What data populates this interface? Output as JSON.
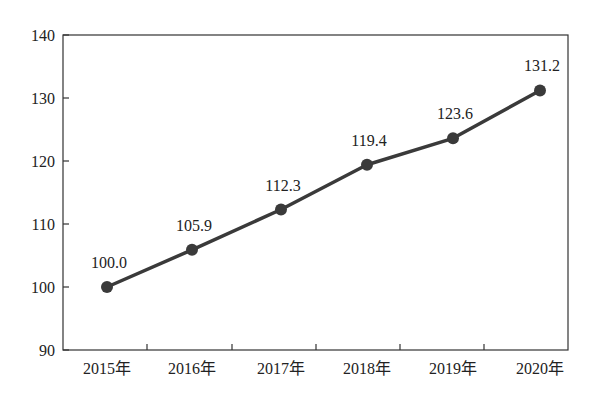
{
  "chart_data": {
    "type": "line",
    "title": "",
    "xlabel": "",
    "ylabel": "",
    "categories": [
      "2015年",
      "2016年",
      "2017年",
      "2018年",
      "2019年",
      "2020年"
    ],
    "series": [
      {
        "name": "index",
        "values": [
          100.0,
          105.9,
          112.3,
          119.4,
          123.6,
          131.2
        ]
      }
    ],
    "data_labels": [
      "100.0",
      "105.9",
      "112.3",
      "119.4",
      "123.6",
      "131.2"
    ],
    "ylim": [
      90,
      140
    ],
    "yticks": [
      "90",
      "100",
      "110",
      "120",
      "130",
      "140"
    ],
    "grid": false,
    "legend": "none",
    "colors": {
      "line": "#3a3a3a",
      "marker": "#3a3a3a",
      "axis": "#333333"
    }
  }
}
